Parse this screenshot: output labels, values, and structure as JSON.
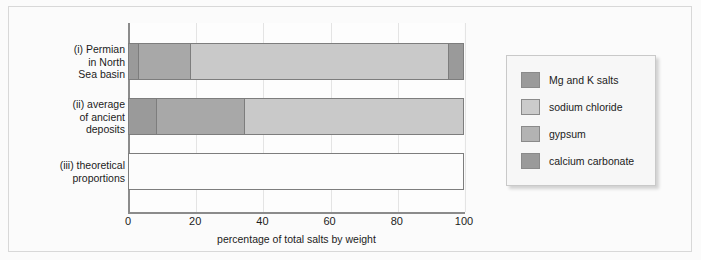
{
  "chart_data": {
    "type": "bar",
    "orientation": "horizontal",
    "stacked": true,
    "title": "",
    "xlabel": "percentage of total salts by weight",
    "ylabel": "",
    "xlim": [
      0,
      100
    ],
    "xticks": [
      0,
      20,
      40,
      60,
      80,
      100
    ],
    "xtick_labels": [
      "0",
      "20",
      "40",
      "60",
      "80",
      "100"
    ],
    "grid": true,
    "grid_axis": "x",
    "legend_position": "right",
    "categories": [
      "(i) Permian\nin North\nSea basin",
      "(ii) average\nof ancient\ndeposits",
      "(iii) theoretical\nproportions"
    ],
    "series": [
      {
        "name": "calcium carbonate",
        "color": "#9a9a9a",
        "values": [
          3,
          8.5,
          0
        ]
      },
      {
        "name": "gypsum",
        "color": "#a8a8a8",
        "values": [
          15.5,
          26,
          0
        ]
      },
      {
        "name": "sodium chloride",
        "color": "#c9c9c9",
        "values": [
          77,
          65.5,
          0
        ]
      },
      {
        "name": "Mg and K salts",
        "color": "#9a9a9a",
        "values": [
          4.5,
          0,
          0
        ]
      }
    ],
    "bars": [
      {
        "label": "(i) Permian\nin North\nSea basin",
        "segments": [
          {
            "series": "calcium carbonate",
            "start": 0,
            "end": 3,
            "width": 3,
            "color": "#9a9a9a"
          },
          {
            "series": "gypsum",
            "start": 3,
            "end": 18.5,
            "width": 15.5,
            "color": "#a8a8a8"
          },
          {
            "series": "sodium chloride",
            "start": 18.5,
            "end": 95.5,
            "width": 77,
            "color": "#c9c9c9"
          },
          {
            "series": "Mg and K salts",
            "start": 95.5,
            "end": 100,
            "width": 4.5,
            "color": "#9a9a9a"
          }
        ]
      },
      {
        "label": "(ii) average\nof ancient\ndeposits",
        "segments": [
          {
            "series": "calcium carbonate",
            "start": 0,
            "end": 8.5,
            "width": 8.5,
            "color": "#9a9a9a"
          },
          {
            "series": "gypsum",
            "start": 8.5,
            "end": 34.5,
            "width": 26,
            "color": "#a8a8a8"
          },
          {
            "series": "sodium chloride",
            "start": 34.5,
            "end": 100,
            "width": 65.5,
            "color": "#c9c9c9"
          }
        ]
      },
      {
        "label": "(iii) theoretical\nproportions",
        "segments": [
          {
            "series": "empty",
            "start": 0,
            "end": 100,
            "width": 100,
            "color": "#fcfcfc"
          }
        ]
      }
    ],
    "legend": [
      {
        "label": "Mg and K salts",
        "color": "#9a9a9a"
      },
      {
        "label": "sodium chloride",
        "color": "#cbcbcb"
      },
      {
        "label": "gypsum",
        "color": "#b3b3b3"
      },
      {
        "label": "calcium carbonate",
        "color": "#9a9a9a"
      }
    ]
  },
  "axis": {
    "x_title": "percentage of total salts by weight",
    "ticks": [
      "0",
      "20",
      "40",
      "60",
      "80",
      "100"
    ]
  },
  "rows": [
    {
      "label": "(i) Permian\nin North\nSea basin"
    },
    {
      "label": "(ii) average\nof ancient\ndeposits"
    },
    {
      "label": "(iii) theoretical\nproportions"
    }
  ],
  "legend": {
    "items": [
      {
        "label": "Mg and K salts"
      },
      {
        "label": "sodium chloride"
      },
      {
        "label": "gypsum"
      },
      {
        "label": "calcium carbonate"
      }
    ]
  },
  "colors": {
    "mg_k_salts": "#9a9a9a",
    "sodium_chloride": "#c9c9c9",
    "gypsum": "#a8a8a8",
    "calcium_carbonate": "#9a9a9a",
    "axis": "#8b8b8b",
    "grid": "#e4e4e4",
    "frame": "#d8d8d8",
    "legend_bg": "#f7f7f7"
  }
}
